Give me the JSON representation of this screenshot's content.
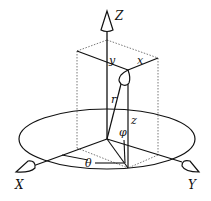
{
  "diagram": {
    "axes": {
      "z_label": "Z",
      "x_label": "X",
      "y_label": "Y"
    },
    "labels": {
      "y": "y",
      "x": "x",
      "r": "r",
      "z": "z",
      "phi": "φ",
      "theta": "θ"
    },
    "colors": {
      "ink": "#111111",
      "background": "#ffffff"
    }
  }
}
